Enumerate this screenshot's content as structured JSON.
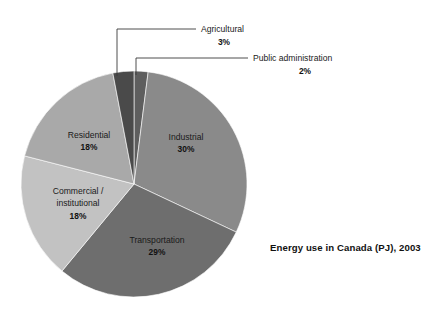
{
  "chart_data": {
    "type": "pie",
    "title": "Energy use in Canada (PJ), 2003",
    "xlabel": "",
    "ylabel": "",
    "legend_position": "none",
    "grid": false,
    "value_unit": "%",
    "categories": [
      "Industrial",
      "Transportation",
      "Commercial / institutional",
      "Residential",
      "Agricultural",
      "Public administration"
    ],
    "values": [
      30,
      29,
      18,
      18,
      3,
      2
    ],
    "slices": [
      {
        "name": "Industrial",
        "label_line1": "Industrial",
        "label_line2": "",
        "percent_text": "30%",
        "value": 30,
        "color": "#8a8a8a",
        "label_placement": "inside"
      },
      {
        "name": "Transportation",
        "label_line1": "Transportation",
        "label_line2": "",
        "percent_text": "29%",
        "value": 29,
        "color": "#6e6e6e",
        "label_placement": "inside"
      },
      {
        "name": "Commercial / institutional",
        "label_line1": "Commercial /",
        "label_line2": "institutional",
        "percent_text": "18%",
        "value": 18,
        "color": "#c2c2c2",
        "label_placement": "inside"
      },
      {
        "name": "Residential",
        "label_line1": "Residential",
        "label_line2": "",
        "percent_text": "18%",
        "value": 18,
        "color": "#a9a9a9",
        "label_placement": "inside"
      },
      {
        "name": "Agricultural",
        "label_line1": "Agricultural",
        "label_line2": "",
        "percent_text": "3%",
        "value": 3,
        "color": "#4a4a4a",
        "label_placement": "callout"
      },
      {
        "name": "Public administration",
        "label_line1": "Public administration",
        "label_line2": "",
        "percent_text": "2%",
        "value": 2,
        "color": "#5e5e5e",
        "label_placement": "callout"
      }
    ]
  },
  "colors": {
    "background": "#ffffff",
    "text": "#1a1a1a",
    "leader_line": "#3a3a3a",
    "slice_border": "#ffffff"
  }
}
